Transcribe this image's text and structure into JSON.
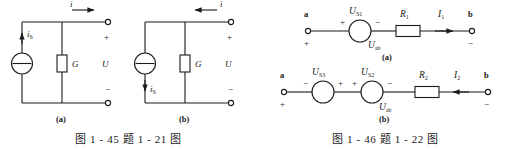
{
  "figures": [
    {
      "id": "fig-1-45",
      "caption": "图 1 - 45   题 1 - 21 图",
      "subfigures": [
        {
          "part_label": "(a)",
          "current_source_label": "iS",
          "conductance_label": "G",
          "voltage_label": "U",
          "terminal_current_label": "i",
          "terminal_current_direction": "right",
          "source_arrow_direction": "up",
          "plus_sign": "+",
          "minus_sign": "−"
        },
        {
          "part_label": "(b)",
          "current_source_label": "iS",
          "conductance_label": "G",
          "voltage_label": "U",
          "terminal_current_label": "i",
          "terminal_current_direction": "left",
          "source_arrow_direction": "down",
          "plus_sign": "+",
          "minus_sign": "−"
        }
      ]
    },
    {
      "id": "fig-1-46",
      "caption": "图 1 - 46   题 1 - 22 图",
      "subfigures": [
        {
          "part_label": "(a)",
          "node_left": "a",
          "node_right": "b",
          "node_left_sign": "+",
          "node_right_sign": "−",
          "sources": [
            {
              "label": "US1",
              "base": "U",
              "sub": "S1",
              "left_sign": "+",
              "right_sign": "−"
            }
          ],
          "resistor_label": "R1",
          "resistor_base": "R",
          "resistor_sub": "1",
          "current_label": "I1",
          "current_base": "I",
          "current_sub": "1",
          "current_direction": "right",
          "branch_voltage_label": "Uab",
          "branch_voltage_base": "U",
          "branch_voltage_sub": "ab"
        },
        {
          "part_label": "(b)",
          "node_left": "a",
          "node_right": "b",
          "node_left_sign": "+",
          "node_right_sign": "−",
          "sources": [
            {
              "label": "US3",
              "base": "U",
              "sub": "S3",
              "left_sign": "−",
              "right_sign": "+"
            },
            {
              "label": "US2",
              "base": "U",
              "sub": "S2",
              "left_sign": "+",
              "right_sign": "−"
            }
          ],
          "resistor_label": "R2",
          "resistor_base": "R",
          "resistor_sub": "2",
          "current_label": "I2",
          "current_base": "I",
          "current_sub": "2",
          "current_direction": "left",
          "branch_voltage_label": "Uab",
          "branch_voltage_base": "U",
          "branch_voltage_sub": "ab"
        }
      ]
    }
  ],
  "colors": {
    "ink": "#1a1a1a",
    "paper": "#ffffff"
  }
}
